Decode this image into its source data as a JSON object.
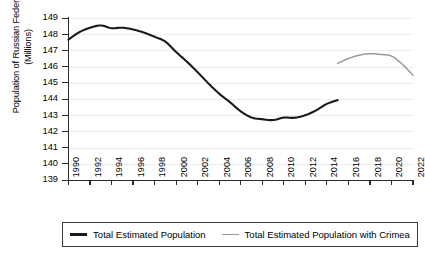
{
  "chart_data": {
    "type": "line",
    "title": "",
    "xlabel": "",
    "ylabel": "Population of Russian Federation\n(Millions)",
    "ylabel_line1": "Population of Russian Federation",
    "ylabel_line2": "(Millions)",
    "xlim": [
      1990,
      2022
    ],
    "ylim": [
      139,
      149
    ],
    "grid": true,
    "legend_position": "bottom",
    "y_ticks": [
      139,
      140,
      141,
      142,
      143,
      144,
      145,
      146,
      147,
      148,
      149
    ],
    "x_ticks": [
      1990,
      1992,
      1994,
      1996,
      1998,
      2000,
      2002,
      2004,
      2006,
      2008,
      2010,
      2012,
      2014,
      2016,
      2018,
      2020,
      2022
    ],
    "x_tick_labels": [
      "1990",
      "1992",
      "1994",
      "1996",
      "1998",
      "2000",
      "2002",
      "2004",
      "2006",
      "2008",
      "2010",
      "2012",
      "2014",
      "2016",
      "2018",
      "2020",
      "2022"
    ],
    "series": [
      {
        "name": "Total Estimated Population",
        "color": "#1a1a1a",
        "x": [
          1990,
          1991,
          1992,
          1993,
          1994,
          1995,
          1996,
          1997,
          1998,
          1999,
          2000,
          2001,
          2002,
          2003,
          2004,
          2005,
          2006,
          2007,
          2008,
          2009,
          2010,
          2011,
          2012,
          2013,
          2014,
          2015
        ],
        "values": [
          147.67,
          148.12,
          148.4,
          148.54,
          148.37,
          148.4,
          148.29,
          148.1,
          147.84,
          147.54,
          146.9,
          146.3,
          145.65,
          144.96,
          144.33,
          143.8,
          143.24,
          142.86,
          142.75,
          142.7,
          142.85,
          142.84,
          143.0,
          143.3,
          143.7,
          143.93
        ]
      },
      {
        "name": "Total Estimated Population with Crimea",
        "color": "#9a9a9a",
        "x": [
          2015,
          2016,
          2017,
          2018,
          2019,
          2020,
          2021,
          2022
        ],
        "values": [
          146.2,
          146.5,
          146.7,
          146.8,
          146.75,
          146.65,
          146.15,
          145.47
        ]
      }
    ]
  },
  "legend": {
    "items": [
      {
        "label": "Total Estimated Population",
        "color": "#1a1a1a"
      },
      {
        "label": "Total Estimated Population with Crimea",
        "color": "#9a9a9a"
      }
    ]
  }
}
